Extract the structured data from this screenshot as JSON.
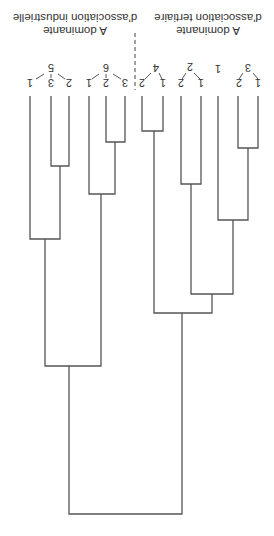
{
  "figure": {
    "type": "dendrogram",
    "orientation": "rotated-180",
    "line_color": "#555555",
    "text_color": "#333333",
    "background": "#ffffff"
  },
  "groups": [
    {
      "id": "industrielle",
      "caption_line1": "A dominante",
      "caption_line2": "d'association industrielle",
      "clusters": [
        {
          "label": "5",
          "leaves": [
            "1",
            "3",
            "2"
          ]
        },
        {
          "label": "6",
          "leaves": [
            "1",
            "2",
            "3"
          ]
        }
      ]
    },
    {
      "id": "tertiaire",
      "caption_line1": "A dominante",
      "caption_line2": "d'association tertiaire",
      "clusters": [
        {
          "label": "4",
          "leaves": [
            "2",
            "1"
          ]
        },
        {
          "label": "2",
          "leaves": [
            "2",
            "1"
          ]
        },
        {
          "label": "1",
          "leaves": []
        },
        {
          "label": "3",
          "leaves": [
            "2",
            "1"
          ]
        }
      ]
    }
  ],
  "labels": {
    "c5": "5",
    "c5_l1": "1",
    "c5_l3": "3",
    "c5_l2": "2",
    "c6": "6",
    "c6_l1": "1",
    "c6_l2": "2",
    "c6_l3": "3",
    "c4": "4",
    "c4_l2": "2",
    "c4_l1": "1",
    "c2": "2",
    "c2_l2": "2",
    "c2_l1": "1",
    "c1": "1",
    "c3": "3",
    "c3_l2": "2",
    "c3_l1": "1",
    "ind_line1": "A dominante",
    "ind_line2": "d'association industrielle",
    "ter_line1": "A dominante",
    "ter_line2": "d'association tertiaire"
  }
}
